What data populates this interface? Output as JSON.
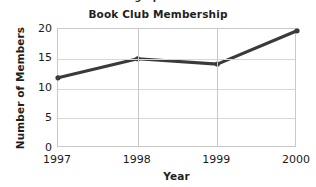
{
  "figure": {
    "clipped_header_text": "Use the graph to answer.",
    "background_color": "#ffffff"
  },
  "chart_data": {
    "type": "line",
    "title": "Book Club Membership",
    "xlabel": "Year",
    "ylabel": "Number of Members",
    "categories": [
      "1997",
      "1998",
      "1999",
      "2000"
    ],
    "x": [
      1997,
      1998,
      1999,
      2000
    ],
    "values": [
      11.8,
      15.0,
      14.1,
      19.7
    ],
    "series": [
      {
        "name": "Number of Members",
        "values": [
          11.8,
          15.0,
          14.1,
          19.7
        ]
      }
    ],
    "ylim": [
      0,
      20
    ],
    "yticks": [
      0,
      5,
      10,
      15,
      20
    ],
    "ytick_labels": [
      "0",
      "5",
      "10",
      "15",
      "20"
    ],
    "xtick_labels": [
      "1997",
      "1998",
      "1999",
      "2000"
    ],
    "grid": true,
    "grid_axis": "both",
    "legend": false,
    "legend_position": "none",
    "line_color": "#3a3a3a",
    "marker": "circle",
    "marker_color": "#3a3a3a",
    "grid_color": "#d7d7d7",
    "axis_color": "#c9c9c9"
  }
}
